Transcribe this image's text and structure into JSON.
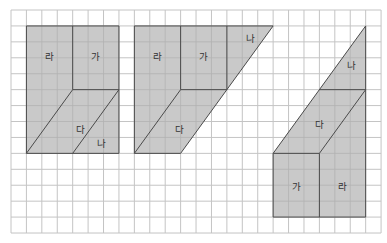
{
  "grid": {
    "cols": 24,
    "rows": 14,
    "origin_x": 11,
    "origin_y": 10,
    "cell_w": 15.42,
    "cell_h": 15.93,
    "line_color": "#c4c4c4"
  },
  "colors": {
    "shape_fill": "#c9c9c9",
    "outline": "#4a4a4a",
    "label": "#333333"
  },
  "figures": [
    {
      "name": "figure-1",
      "outline": [
        [
          1,
          1
        ],
        [
          7,
          1
        ],
        [
          7,
          9
        ],
        [
          1,
          9
        ]
      ],
      "edges": [
        [
          [
            4,
            1
          ],
          [
            4,
            5
          ]
        ],
        [
          [
            4,
            5
          ],
          [
            7,
            5
          ]
        ],
        [
          [
            1,
            9
          ],
          [
            4,
            5
          ]
        ],
        [
          [
            4,
            9
          ],
          [
            7,
            5
          ]
        ]
      ],
      "labels": [
        {
          "text": "라",
          "col": 2.5,
          "row": 2.9
        },
        {
          "text": "가",
          "col": 5.5,
          "row": 2.9
        },
        {
          "text": "다",
          "col": 4.5,
          "row": 7.5
        },
        {
          "text": "나",
          "col": 5.9,
          "row": 8.4
        }
      ]
    },
    {
      "name": "figure-2",
      "outline": [
        [
          8,
          1
        ],
        [
          17,
          1
        ],
        [
          11,
          9
        ],
        [
          8,
          9
        ]
      ],
      "edges": [
        [
          [
            11,
            1
          ],
          [
            11,
            5
          ]
        ],
        [
          [
            14,
            1
          ],
          [
            14,
            5
          ]
        ],
        [
          [
            11,
            5
          ],
          [
            14,
            5
          ]
        ],
        [
          [
            8,
            9
          ],
          [
            11,
            5
          ]
        ]
      ],
      "labels": [
        {
          "text": "라",
          "col": 9.5,
          "row": 2.9
        },
        {
          "text": "가",
          "col": 12.5,
          "row": 2.9
        },
        {
          "text": "나",
          "col": 15.5,
          "row": 1.8
        },
        {
          "text": "다",
          "col": 10.9,
          "row": 7.5
        }
      ]
    },
    {
      "name": "figure-3",
      "outline": [
        [
          17,
          13
        ],
        [
          17,
          9
        ],
        [
          23,
          1
        ],
        [
          23,
          13
        ]
      ],
      "edges": [
        [
          [
            20,
            9
          ],
          [
            20,
            13
          ]
        ],
        [
          [
            17,
            9
          ],
          [
            20,
            9
          ]
        ],
        [
          [
            20,
            5
          ],
          [
            23,
            5
          ]
        ],
        [
          [
            20,
            9
          ],
          [
            23,
            5
          ]
        ]
      ],
      "labels": [
        {
          "text": "나",
          "col": 22.1,
          "row": 3.5
        },
        {
          "text": "다",
          "col": 20.0,
          "row": 7.2
        },
        {
          "text": "가",
          "col": 18.5,
          "row": 11.1
        },
        {
          "text": "라",
          "col": 21.5,
          "row": 11.1
        }
      ]
    }
  ]
}
